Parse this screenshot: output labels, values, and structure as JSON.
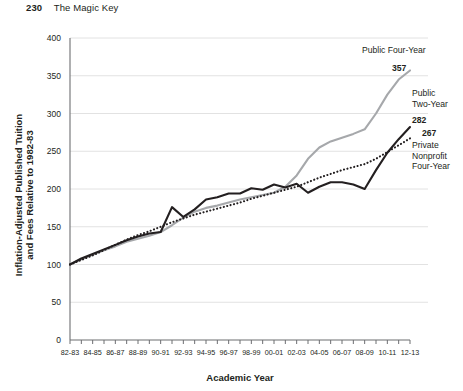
{
  "page": {
    "folio": "230",
    "running_head": "The Magic Key"
  },
  "chart_data": {
    "type": "line",
    "title": "",
    "xlabel": "Academic Year",
    "ylabel": "Inflation-Adjusted Published Tuition and Fees Relative to 1982-83",
    "ylim": [
      0,
      400
    ],
    "ytick_values": [
      0,
      50,
      100,
      150,
      200,
      250,
      300,
      350,
      400
    ],
    "ytick_labels": [
      "0",
      "50",
      "100",
      "150",
      "200",
      "250",
      "300",
      "350",
      "400"
    ],
    "grid": "horizontal",
    "legend_position": "inline-right-annotations",
    "x": [
      "82-83",
      "83-84",
      "84-85",
      "85-86",
      "86-87",
      "87-88",
      "88-89",
      "89-90",
      "90-91",
      "91-92",
      "92-93",
      "93-94",
      "94-95",
      "95-96",
      "96-97",
      "97-98",
      "98-99",
      "99-00",
      "00-01",
      "01-02",
      "02-03",
      "03-04",
      "04-05",
      "05-06",
      "06-07",
      "07-08",
      "08-09",
      "09-10",
      "10-11",
      "11-12",
      "12-13"
    ],
    "xtick_labels": [
      "82-83",
      "84-85",
      "86-87",
      "88-89",
      "90-91",
      "92-93",
      "94-95",
      "96-97",
      "98-99",
      "00-01",
      "02-03",
      "04-05",
      "06-07",
      "08-09",
      "10-11",
      "12-13"
    ],
    "xtick_label_interval": 2,
    "series": [
      {
        "name": "Public Four-Year",
        "label": "Public Four-Year",
        "end_value": 357,
        "end_value_label": "357",
        "color": "#a6a8ab",
        "style": "solid",
        "width": 2.1,
        "values": [
          100,
          107,
          113,
          119,
          124,
          130,
          134,
          138,
          143,
          152,
          162,
          170,
          175,
          178,
          182,
          186,
          189,
          192,
          195,
          203,
          218,
          240,
          255,
          263,
          268,
          273,
          279,
          300,
          325,
          345,
          357
        ]
      },
      {
        "name": "Public Two-Year",
        "label": "Public Two-Year",
        "end_value": 282,
        "end_value_label": "282",
        "color": "#231f20",
        "style": "solid",
        "width": 2.1,
        "values": [
          100,
          108,
          114,
          120,
          126,
          132,
          137,
          141,
          143,
          176,
          163,
          173,
          186,
          189,
          194,
          194,
          201,
          199,
          206,
          202,
          207,
          195,
          203,
          209,
          209,
          206,
          200,
          225,
          248,
          266,
          282
        ]
      },
      {
        "name": "Private Nonprofit Four-Year",
        "label": "Private Nonprofit Four-Year",
        "end_value": 267,
        "end_value_label": "267",
        "color": "#231f20",
        "style": "dotted",
        "width": 2.1,
        "values": [
          100,
          106,
          112,
          119,
          126,
          133,
          139,
          144,
          150,
          156,
          161,
          166,
          170,
          174,
          178,
          182,
          187,
          191,
          195,
          199,
          203,
          209,
          215,
          220,
          225,
          229,
          233,
          240,
          249,
          258,
          267
        ]
      }
    ],
    "annotations": [
      {
        "text": "Public Four-Year",
        "value": "357"
      },
      {
        "text": "Public Two-Year",
        "value": "282"
      },
      {
        "text": "Private Nonprofit Four-Year",
        "value": "267"
      }
    ]
  },
  "colors": {
    "ink": "#231f20",
    "gray_series": "#a6a8ab",
    "grid": "#e2e2e2",
    "axis": "#6d6e71"
  }
}
